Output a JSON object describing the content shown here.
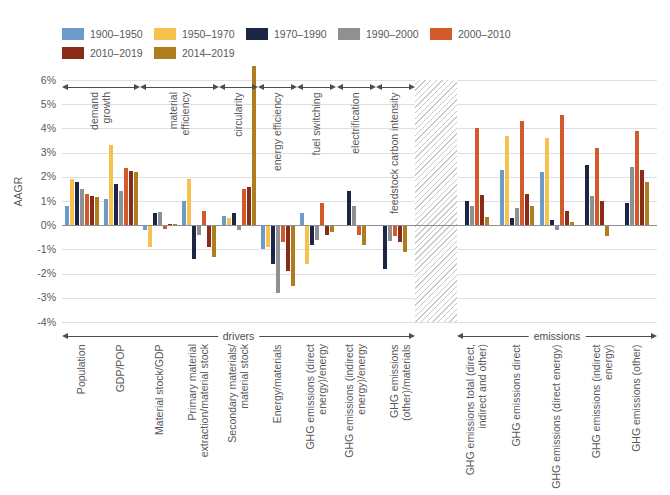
{
  "y_axis": {
    "label": "AAGR",
    "ticks": [
      "6%",
      "5%",
      "4%",
      "3%",
      "2%",
      "1%",
      "0%",
      "-1%",
      "-2%",
      "-3%",
      "-4%"
    ],
    "tick_values": [
      6,
      5,
      4,
      3,
      2,
      1,
      0,
      -1,
      -2,
      -3,
      -4
    ]
  },
  "chart_data": {
    "type": "bar",
    "title": "",
    "xlabel": "",
    "ylabel": "AAGR",
    "ylim": [
      -4,
      6
    ],
    "grid": true,
    "legend_position": "top",
    "series": [
      {
        "name": "1900–1950",
        "color": "#6d9bc9"
      },
      {
        "name": "1950–1970",
        "color": "#f6c14d"
      },
      {
        "name": "1970–1990",
        "color": "#1b2644"
      },
      {
        "name": "1990–2000",
        "color": "#8e9093"
      },
      {
        "name": "2000–2010",
        "color": "#d2592a"
      },
      {
        "name": "2010–2019",
        "color": "#8a2a18"
      },
      {
        "name": "2014–2019",
        "color": "#b07d1e"
      }
    ],
    "sections": [
      {
        "name": "drivers",
        "groups": [
          {
            "label": "Population",
            "lines": [
              "Population"
            ],
            "values": [
              0.8,
              1.9,
              1.8,
              1.5,
              1.3,
              1.2,
              1.15
            ]
          },
          {
            "label": "GDP/POP",
            "lines": [
              "GDP/POP"
            ],
            "values": [
              1.1,
              3.3,
              1.7,
              1.4,
              2.35,
              2.25,
              2.2
            ]
          },
          {
            "label": "Material stock/GDP",
            "lines": [
              "Material stock/GDP"
            ],
            "values": [
              -0.2,
              -0.9,
              0.5,
              0.55,
              -0.15,
              0.05,
              0.05
            ]
          },
          {
            "label": "Primary material extraction/material stock",
            "lines": [
              "Primary material",
              "extraction/material stock"
            ],
            "values": [
              1.0,
              1.9,
              -1.4,
              -0.4,
              0.6,
              -0.9,
              -1.3
            ]
          },
          {
            "label": "Secondary materials/material stock",
            "lines": [
              "Secondary materials/",
              "material stock"
            ],
            "values": [
              0.4,
              0.3,
              0.5,
              -0.2,
              1.5,
              1.6,
              6.6
            ]
          },
          {
            "label": "Energy/materials",
            "lines": [
              "Energy/materials"
            ],
            "values": [
              -1.0,
              -0.9,
              -1.6,
              -2.8,
              -0.7,
              -1.9,
              -2.5
            ]
          },
          {
            "label": "GHG emissions (direct energy)/energy",
            "lines": [
              "GHG emissions (direct",
              "energy)/energy"
            ],
            "values": [
              0.5,
              -1.6,
              -0.8,
              -0.6,
              0.9,
              -0.4,
              -0.3
            ]
          },
          {
            "label": "GHG emissions (indirect energy)/energy",
            "lines": [
              "GHG emissions (indirect",
              "energy)/energy"
            ],
            "values": [
              null,
              null,
              1.4,
              0.8,
              -0.4,
              null,
              -0.8
            ]
          },
          {
            "label": "GHG emissions (other)/materials",
            "lines": [
              "GHG emissions (other)/materials"
            ],
            "values": [
              null,
              null,
              -1.8,
              -0.65,
              -0.45,
              -0.7,
              -1.1
            ]
          }
        ]
      },
      {
        "name": "emissions",
        "groups": [
          {
            "label": "GHG emissions total (direct, indirect and other)",
            "lines": [
              "GHG emissions total (direct,",
              "indirect and other)"
            ],
            "values": [
              null,
              null,
              1.0,
              0.8,
              4.0,
              1.25,
              0.35
            ]
          },
          {
            "label": "GHG emissions direct",
            "lines": [
              "GHG emissions direct"
            ],
            "values": [
              2.3,
              3.7,
              0.3,
              0.7,
              4.3,
              1.3,
              0.8
            ]
          },
          {
            "label": "GHG emissions (direct energy)",
            "lines": [
              "GHG emissions (direct energy)"
            ],
            "values": [
              2.2,
              3.6,
              0.2,
              -0.2,
              4.55,
              0.6,
              0.15
            ]
          },
          {
            "label": "GHG emissions (indirect energy)",
            "lines": [
              "GHG emissions (indirect energy)"
            ],
            "values": [
              null,
              null,
              2.5,
              1.2,
              3.2,
              1.0,
              -0.45
            ]
          },
          {
            "label": "GHG emissions (other)",
            "lines": [
              "GHG emissions (other)"
            ],
            "values": [
              null,
              null,
              0.9,
              2.4,
              3.9,
              2.3,
              1.8
            ]
          }
        ]
      }
    ],
    "annotations": [
      {
        "label": "demand growth",
        "lines": [
          "demand",
          "growth"
        ],
        "from": 0,
        "to": 1
      },
      {
        "label": "material efficiency",
        "lines": [
          "material",
          "efficiency"
        ],
        "from": 2,
        "to": 3
      },
      {
        "label": "circularity",
        "lines": [
          "circularity"
        ],
        "from": 4,
        "to": 4
      },
      {
        "label": "energy efficiency",
        "lines": [
          "energy efficiency"
        ],
        "from": 5,
        "to": 5
      },
      {
        "label": "fuel switching",
        "lines": [
          "fuel switching"
        ],
        "from": 6,
        "to": 6
      },
      {
        "label": "electrification",
        "lines": [
          "electrification"
        ],
        "from": 7,
        "to": 7
      },
      {
        "label": "feedstock carbon intensity",
        "lines": [
          "feedstock carbon intensity"
        ],
        "from": 8,
        "to": 8
      }
    ],
    "section_arrows": [
      {
        "label": "drivers"
      },
      {
        "label": "emissions"
      }
    ]
  }
}
